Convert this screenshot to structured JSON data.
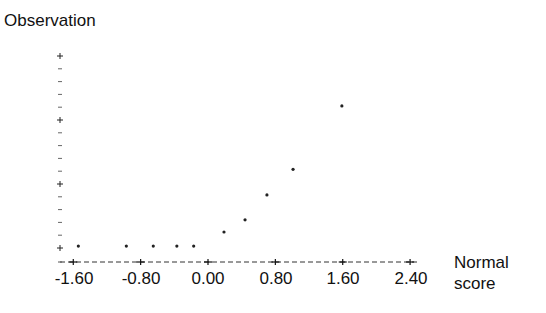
{
  "chart_data": {
    "type": "scatter",
    "title": "",
    "xlabel": "Normal score",
    "ylabel": "Observation",
    "xlabel_lines": [
      "Normal",
      "score"
    ],
    "x_ticks": [
      -1.6,
      -0.8,
      0.0,
      0.8,
      1.6,
      2.4
    ],
    "x_tick_labels": [
      "-1.60",
      "-0.80",
      "0.00",
      "0.80",
      "1.60",
      "2.40"
    ],
    "xlim": [
      -1.72,
      2.45
    ],
    "y_ticks_major_count": 4,
    "y_minor_per_major": 4,
    "y_tick_labels": [],
    "y_units": "relative (unlabeled axis; lowest major tick = 0, one major interval = 1)",
    "ylim": [
      -0.22,
      3.0
    ],
    "grid": false,
    "legend": null,
    "axis_style": "dashed x-axis with '+' tick marks, dotted y-axis with '+' major and '-' minor ticks",
    "points": [
      {
        "x": -1.54,
        "y": 0.03
      },
      {
        "x": -0.97,
        "y": 0.03
      },
      {
        "x": -0.65,
        "y": 0.03
      },
      {
        "x": -0.37,
        "y": 0.03
      },
      {
        "x": -0.17,
        "y": 0.03
      },
      {
        "x": 0.19,
        "y": 0.25
      },
      {
        "x": 0.44,
        "y": 0.44
      },
      {
        "x": 0.7,
        "y": 0.83
      },
      {
        "x": 1.01,
        "y": 1.23
      },
      {
        "x": 1.59,
        "y": 2.22
      }
    ]
  },
  "labels": {
    "ylabel": "Observation",
    "xlabel_line1": "Normal",
    "xlabel_line2": "score",
    "xticks": [
      "-1.60",
      "-0.80",
      "0.00",
      "0.80",
      "1.60",
      "2.40"
    ]
  }
}
